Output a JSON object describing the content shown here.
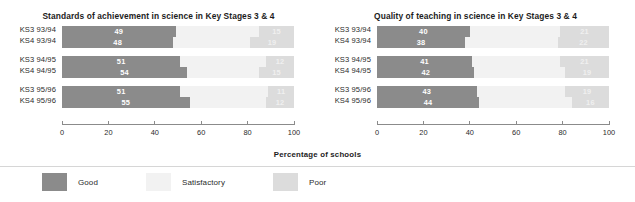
{
  "axis_caption": "Percentage of schools",
  "colors": {
    "good": "#8b8b8b",
    "satisfactory": "#f2f2f2",
    "poor": "#dcdcdc",
    "axis": "#8b8b8b",
    "text": "#2b2b2b"
  },
  "legend": {
    "items": [
      {
        "label": "Good",
        "color": "#8b8b8b",
        "key": "good"
      },
      {
        "label": "Satisfactory",
        "color": "#f2f2f2",
        "key": "satisfactory"
      },
      {
        "label": "Poor",
        "color": "#dcdcdc",
        "key": "poor"
      }
    ]
  },
  "chart_data": [
    {
      "type": "bar",
      "orientation": "horizontal",
      "stacked": true,
      "title": "Standards of achievement in science in Key Stages 3 & 4",
      "xlabel": "Percentage of schools",
      "ylabel": "",
      "xlim": [
        0,
        100
      ],
      "ticks": [
        0,
        20,
        40,
        60,
        80,
        100
      ],
      "tick_labels": [
        "0",
        "20",
        "40",
        "60",
        "80",
        "100"
      ],
      "grid": false,
      "legend_position": "bottom",
      "categories": [
        "KS3 93/94",
        "KS4 93/94",
        "KS3 94/95",
        "KS4 94/95",
        "KS3 95/96",
        "KS4 95/96"
      ],
      "group_breaks": [
        2,
        4
      ],
      "series": [
        {
          "name": "Good",
          "color": "#8b8b8b",
          "values": [
            49,
            48,
            51,
            54,
            51,
            55
          ]
        },
        {
          "name": "Satisfactory",
          "color": "#f2f2f2",
          "values": [
            36,
            33,
            37,
            31,
            38,
            33
          ]
        },
        {
          "name": "Poor",
          "color": "#dcdcdc",
          "values": [
            15,
            19,
            12,
            15,
            11,
            12
          ]
        }
      ]
    },
    {
      "type": "bar",
      "orientation": "horizontal",
      "stacked": true,
      "title": "Quality of teaching in science in Key Stages 3 & 4",
      "xlabel": "Percentage of schools",
      "ylabel": "",
      "xlim": [
        0,
        100
      ],
      "ticks": [
        0,
        20,
        40,
        60,
        80,
        100
      ],
      "tick_labels": [
        "0",
        "20",
        "40",
        "60",
        "80",
        "100"
      ],
      "grid": false,
      "legend_position": "bottom",
      "categories": [
        "KS3 93/94",
        "KS4 93/94",
        "KS3 94/95",
        "KS4 94/95",
        "KS3 95/96",
        "KS4 95/96"
      ],
      "group_breaks": [
        2,
        4
      ],
      "series": [
        {
          "name": "Good",
          "color": "#8b8b8b",
          "values": [
            40,
            38,
            41,
            42,
            43,
            44
          ]
        },
        {
          "name": "Satisfactory",
          "color": "#f2f2f2",
          "values": [
            39,
            40,
            38,
            39,
            38,
            40
          ]
        },
        {
          "name": "Poor",
          "color": "#dcdcdc",
          "values": [
            21,
            22,
            21,
            19,
            19,
            16
          ]
        }
      ]
    }
  ]
}
